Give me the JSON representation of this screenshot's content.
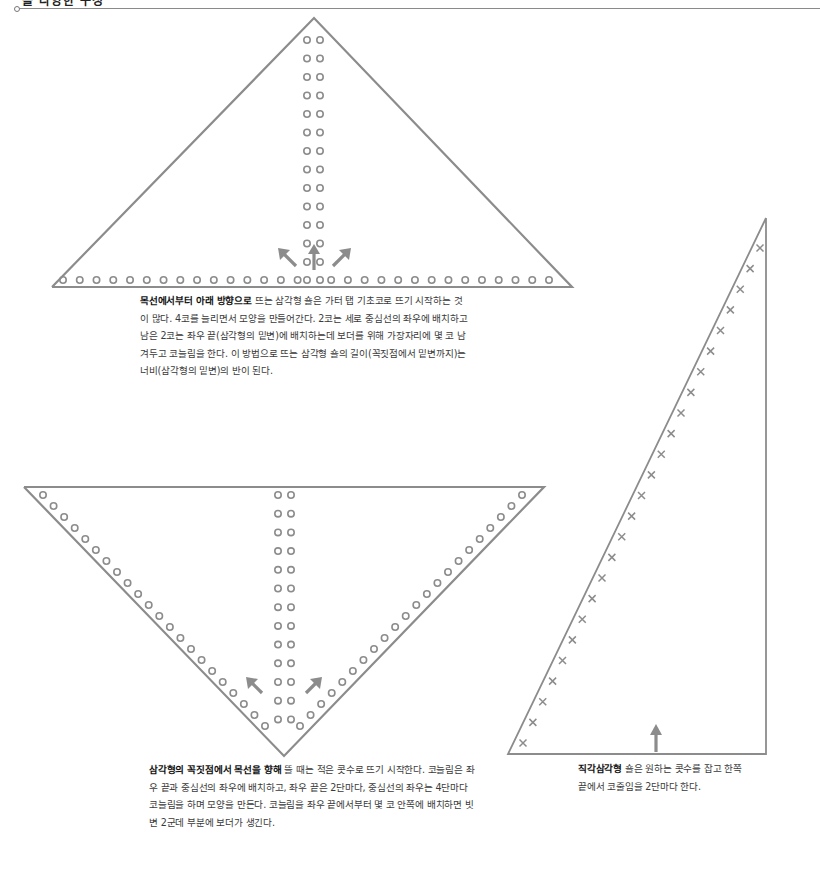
{
  "header": {
    "title": "숄 다양한 구성"
  },
  "colors": {
    "line": "#8c8c8c",
    "stitch": "#8c8c8c",
    "arrow": "#8c8c8c",
    "text": "#3a3a3a",
    "bold_text": "#111111"
  },
  "diagrams": [
    {
      "id": "top-down-triangle",
      "shape": "triangle-apex-up",
      "marker": "circle",
      "center_column_pairs": 13,
      "base_row_count": 30,
      "arrows": [
        "up-left",
        "up",
        "up-right"
      ],
      "caption": {
        "bold": "목선에서부터 아래 방향으로",
        "text": " 뜨는 삼각형 숄은 가터 탭 기초코로 뜨기 시작하는 것이 많다. 4코를 늘리면서 모양을 만들어간다. 2코는 세로 중심선의 좌우에 배치하고 남은 2코는 좌우 끝(삼각형의 밑변)에 배치하는데 보더를 위해 가장자리에 몇 코 남겨두고 코늘림을 한다. 이 방법으로 뜨는 삼각형 숄의 길이(꼭짓점에서 밑변까지)는 너비(삼각형의 밑변)의 반이 된다."
      }
    },
    {
      "id": "bottom-up-triangle",
      "shape": "triangle-apex-down",
      "marker": "circle",
      "center_column_pairs": 13,
      "edge_marker_count_per_side": 22,
      "arrows": [
        "up-left",
        "up-right"
      ],
      "caption": {
        "bold": "삼각형의 꼭짓점에서 목선을 향해",
        "text": " 뜰 때는 적은 콧수로 뜨기 시작한다. 코늘림은 좌우 끝과 중심선의 좌우에 배치하고, 좌우 끝은 2단마다, 중심선의 좌우는 4단마다 코늘림을 하며 모양을 만든다. 코늘림을 좌우 끝에서부터 몇 코 안쪽에 배치하면 빗변 2군데 부분에 보더가 생긴다."
      }
    },
    {
      "id": "right-triangle",
      "shape": "right-triangle",
      "marker": "cross",
      "edge_marker_count": 25,
      "arrows": [
        "up"
      ],
      "caption": {
        "bold": "직각삼각형",
        "text": " 숄은 원하는 콧수를 잡고 한쪽 끝에서 코줄임을 2단마다 한다."
      }
    }
  ]
}
